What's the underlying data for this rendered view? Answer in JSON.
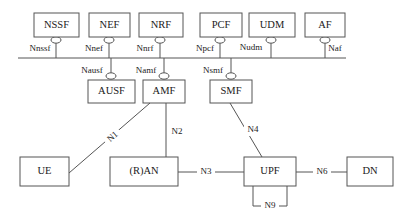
{
  "diagram": {
    "background_color": "#ffffff",
    "line_color": "#555555",
    "text_color": "#1a1a1a"
  },
  "service_bus": {
    "name": "service-based-interface-bus",
    "x1": 18,
    "x2": 346,
    "y": 58
  },
  "top_nodes": [
    {
      "id": "nssf",
      "label": "NSSF",
      "sbi": "Nnssf",
      "box_x": 34,
      "box_y": 13,
      "box_w": 45,
      "box_h": 24,
      "stub_x": 56,
      "sbi_label_x": 40,
      "sbi_label_y": 47
    },
    {
      "id": "nef",
      "label": "NEF",
      "sbi": "Nnef",
      "box_x": 89,
      "box_y": 13,
      "box_w": 41,
      "box_h": 24,
      "stub_x": 109,
      "sbi_label_x": 95,
      "sbi_label_y": 47
    },
    {
      "id": "nrf",
      "label": "NRF",
      "sbi": "Nnrf",
      "box_x": 139,
      "box_y": 13,
      "box_w": 44,
      "box_h": 24,
      "stub_x": 160,
      "sbi_label_x": 145,
      "sbi_label_y": 47
    },
    {
      "id": "pcf",
      "label": "PCF",
      "sbi": "Npcf",
      "box_x": 200,
      "box_y": 13,
      "box_w": 42,
      "box_h": 24,
      "stub_x": 220,
      "sbi_label_x": 205,
      "sbi_label_y": 47
    },
    {
      "id": "udm",
      "label": "UDM",
      "sbi": "Nudm",
      "box_x": 249,
      "box_y": 13,
      "box_w": 46,
      "box_h": 24,
      "stub_x": 271,
      "sbi_label_x": 253,
      "sbi_label_y": 45
    },
    {
      "id": "af",
      "label": "AF",
      "sbi": "Naf",
      "box_x": 305,
      "box_y": 13,
      "box_w": 40,
      "box_h": 24,
      "stub_x": 325,
      "sbi_label_x": 334,
      "sbi_label_y": 47
    }
  ],
  "middle_nodes": [
    {
      "id": "ausf",
      "label": "AUSF",
      "sbi": "Nausf",
      "box_x": 88,
      "box_y": 80,
      "box_w": 47,
      "box_h": 23,
      "stub_x": 111,
      "sbi_label_x": 92,
      "sbi_label_y": 69
    },
    {
      "id": "amf",
      "label": "AMF",
      "sbi": "Namf",
      "box_x": 143,
      "box_y": 80,
      "box_w": 42,
      "box_h": 23,
      "stub_x": 164,
      "sbi_label_x": 146,
      "sbi_label_y": 69
    },
    {
      "id": "smf",
      "label": "SMF",
      "sbi": "Nsmf",
      "box_x": 210,
      "box_y": 80,
      "box_w": 42,
      "box_h": 23,
      "stub_x": 231,
      "sbi_label_x": 213,
      "sbi_label_y": 69
    }
  ],
  "bottom_nodes": [
    {
      "id": "ue",
      "label": "UE",
      "box_x": 20,
      "box_y": 157,
      "box_w": 49,
      "box_h": 29
    },
    {
      "id": "ran",
      "label": "(R)AN",
      "box_x": 110,
      "box_y": 157,
      "box_w": 68,
      "box_h": 29
    },
    {
      "id": "upf",
      "label": "UPF",
      "box_x": 244,
      "box_y": 157,
      "box_w": 52,
      "box_h": 29
    },
    {
      "id": "dn",
      "label": "DN",
      "box_x": 347,
      "box_y": 157,
      "box_w": 46,
      "box_h": 29
    }
  ],
  "reference_points": [
    {
      "id": "n1",
      "label": "N1",
      "from": "ue",
      "to": "amf",
      "label_x": 113,
      "label_y": 137,
      "rotated": true,
      "rotation": -42
    },
    {
      "id": "n2",
      "label": "N2",
      "from": "ran",
      "to": "amf",
      "label_x": 172,
      "label_y": 132,
      "rotated": false,
      "rotation": 0
    },
    {
      "id": "n3",
      "label": "N3",
      "from": "ran",
      "to": "upf",
      "label_x": 205,
      "label_y": 172,
      "rotated": false,
      "rotation": 0
    },
    {
      "id": "n4",
      "label": "N4",
      "from": "smf",
      "to": "upf",
      "label_x": 249,
      "label_y": 130,
      "rotated": false,
      "rotation": 0
    },
    {
      "id": "n6",
      "label": "N6",
      "from": "upf",
      "to": "dn",
      "label_x": 322,
      "label_y": 172,
      "rotated": false,
      "rotation": 0
    },
    {
      "id": "n9",
      "label": "N9",
      "from": "upf",
      "to": "upf",
      "label_x": 270,
      "label_y": 206,
      "rotated": false,
      "rotation": 0
    }
  ]
}
